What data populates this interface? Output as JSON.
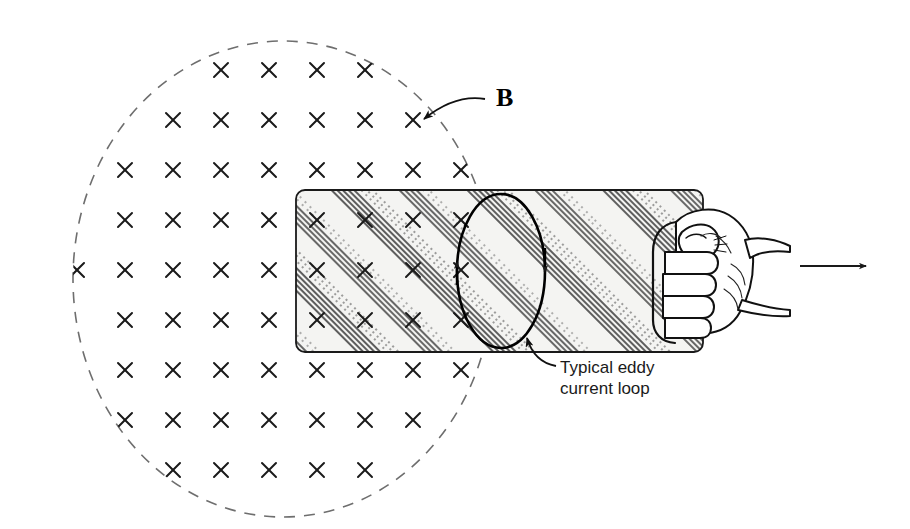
{
  "figure": {
    "domain": "physics-diagram",
    "width": 910,
    "height": 529,
    "background_color": "#ffffff"
  },
  "field_region": {
    "name": "magnetic-field-region",
    "shape": "dashed-ellipse",
    "center_x": 283,
    "center_y": 279,
    "radius_x": 210,
    "radius_y": 238,
    "stroke_color": "#6e6e6e",
    "stroke_width": 1.6,
    "dash_pattern": "11 9",
    "field_direction": "into-page",
    "marker_glyph": "x",
    "marker_color": "#1a1a1a",
    "grid_spacing_x": 48,
    "grid_spacing_y": 50,
    "grid_origin_x": 77,
    "grid_origin_y": 70,
    "grid_cols": 9,
    "grid_rows": 9
  },
  "field_label": {
    "name": "field-label-B",
    "text": "B",
    "x": 496,
    "y": 106,
    "leader_from_x": 485,
    "leader_from_y": 99,
    "leader_to_x": 424,
    "leader_to_y": 119,
    "leader_control_x": 455,
    "leader_control_y": 94
  },
  "plate": {
    "name": "metal-plate",
    "x": 296,
    "y": 190,
    "width": 407,
    "height": 162,
    "corner_radius": 9,
    "fill_color": "#f2f2f0",
    "stroke_color": "#1a1a1a",
    "stroke_width": 1.6,
    "hatch_angle_deg": 45,
    "hatch_color": "#2b2b2b",
    "hatch_description": "diagonal shaded bands running lower-left to upper-right"
  },
  "eddy_loop": {
    "name": "eddy-current-loop",
    "center_x": 501,
    "center_y": 271,
    "radius_x": 44,
    "radius_y": 77,
    "stroke_color": "#000000",
    "stroke_width": 2.6,
    "circulation": "clockwise",
    "arrow_left_direction": "up",
    "arrow_right_direction": "down",
    "arrow_left_x": 457,
    "arrow_left_y": 272,
    "arrow_right_x": 545,
    "arrow_right_y": 264
  },
  "eddy_label": {
    "name": "eddy-current-label",
    "line1": "Typical eddy",
    "line2": "current loop",
    "x": 560,
    "line1_y": 373,
    "line2_y": 394,
    "leader_from_x": 556,
    "leader_from_y": 366,
    "leader_to_x": 527,
    "leader_to_y": 338,
    "leader_control_x": 534,
    "leader_control_y": 362
  },
  "hand": {
    "name": "hand-gripping-plate",
    "description": "closed fist gripping the right edge of the plate",
    "x": 655,
    "y": 205,
    "width": 140,
    "height": 140,
    "stroke_color": "#111111",
    "fill_color": "#ffffff"
  },
  "motion_arrow": {
    "name": "motion-arrow",
    "direction": "right",
    "x_start": 800,
    "x_end": 872,
    "y": 266,
    "stroke_color": "#1a1a1a",
    "stroke_width": 2
  }
}
